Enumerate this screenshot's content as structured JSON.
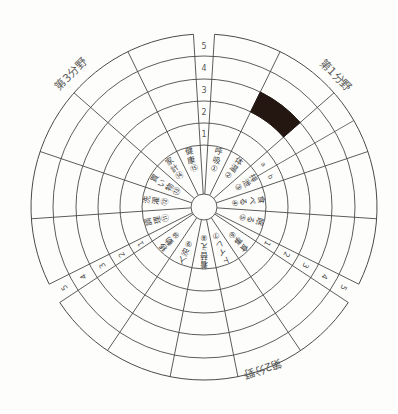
{
  "chart_data": {
    "type": "polar-grid-assessment",
    "title": "",
    "rings": [
      "1",
      "2",
      "3",
      "4",
      "5"
    ],
    "ring_range": [
      1,
      5
    ],
    "legend_position": "none",
    "grid": true,
    "domains": [
      {
        "label": "第1分野",
        "items": [
          {
            "no": 1,
            "symbol": "①",
            "label": "呼吸"
          },
          {
            "no": 2,
            "symbol": "②",
            "label": "体温"
          },
          {
            "no": 3,
            "symbol": "③",
            "label": "排泄",
            "subdivisions": [
              "a",
              "b"
            ]
          },
          {
            "no": 4,
            "symbol": "④",
            "label": "食べる"
          },
          {
            "no": 5,
            "symbol": "⑤",
            "label": "眠る"
          }
        ]
      },
      {
        "label": "第2分野",
        "items": [
          {
            "no": 6,
            "symbol": "⑥",
            "label": "食事"
          },
          {
            "no": 7,
            "symbol": "⑦",
            "label": "トイレ"
          },
          {
            "no": 8,
            "symbol": "⑧",
            "label": "着替え"
          },
          {
            "no": 9,
            "symbol": "⑨",
            "label": "入浴"
          },
          {
            "no": 10,
            "symbol": "⑩",
            "label": "移動"
          }
        ]
      },
      {
        "label": "第3分野",
        "items": [
          {
            "no": 11,
            "symbol": "⑪",
            "label": "調理"
          },
          {
            "no": 12,
            "symbol": "⑫",
            "label": "洗濯"
          },
          {
            "no": 13,
            "symbol": "⑬",
            "label": "買い物"
          },
          {
            "no": 14,
            "symbol": "⑭",
            "label": "家計"
          },
          {
            "no": 15,
            "symbol": "⑮",
            "label": "健康"
          }
        ]
      }
    ],
    "filled_cells": [
      {
        "item_no": 2,
        "band": 3
      }
    ],
    "colors": {
      "line": "#4a4a48",
      "item_text": "#3c3c3a",
      "scale_text": "#585856",
      "domain_text": "#5a5a58",
      "filled_cell": "#241712",
      "paper": "#fdfdfc"
    },
    "layout": {
      "width": 398,
      "height": 414,
      "cx": 204,
      "cy": 207,
      "hub_radius": 13,
      "ring_radii": [
        62,
        84,
        106,
        128,
        151,
        173
      ],
      "sector_span_deg": 22.6,
      "domain_gap_deg": 7,
      "first_sector_start_deg": 3.5,
      "scale_gap_center_deg": [
        0,
        120,
        240
      ],
      "scale_number_radii": [
        73,
        95,
        117,
        139,
        161
      ],
      "item_label_outer_radius": 57,
      "item_label_char_step": 8.7,
      "sub_label_radius": 73,
      "domain_label_angles": [
        45,
        160,
        315
      ],
      "domain_label_radii": [
        186,
        172,
        188
      ]
    }
  }
}
